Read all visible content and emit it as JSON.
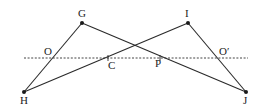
{
  "diagram": {
    "points": {
      "G": {
        "label": "G",
        "x": 82,
        "y": 23,
        "lx": 78,
        "ly": 17
      },
      "I": {
        "label": "I",
        "x": 188,
        "y": 23,
        "lx": 185,
        "ly": 17
      },
      "H": {
        "label": "H",
        "x": 24,
        "y": 92,
        "lx": 20,
        "ly": 104
      },
      "J": {
        "label": "J",
        "x": 246,
        "y": 92,
        "lx": 243,
        "ly": 104
      }
    },
    "intersections": {
      "O": {
        "label": "O",
        "x": 54,
        "y": 58,
        "lx": 44,
        "ly": 55
      },
      "C": {
        "label": "C",
        "x": 108,
        "y": 58,
        "lx": 108,
        "ly": 69
      },
      "P": {
        "label": "P",
        "x": 160,
        "y": 58,
        "lx": 155,
        "ly": 67
      },
      "O_prime": {
        "label": "O′",
        "x": 217,
        "y": 58,
        "lx": 219,
        "ly": 55
      }
    },
    "segments": [
      {
        "from": "H",
        "to": "G"
      },
      {
        "from": "G",
        "to": "J"
      },
      {
        "from": "H",
        "to": "I"
      },
      {
        "from": "I",
        "to": "J"
      }
    ],
    "dotted_line": {
      "x1": 24,
      "y1": 58,
      "x2": 248,
      "y2": 58
    }
  }
}
